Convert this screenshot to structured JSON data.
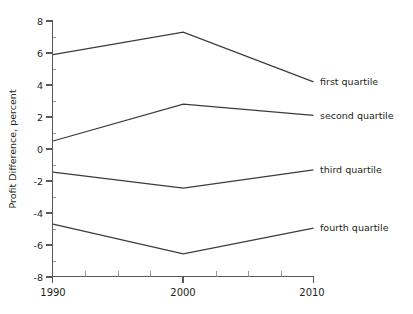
{
  "chart_data": {
    "type": "line",
    "title": "",
    "xlabel": "",
    "ylabel": "Profit Difference, percent",
    "x": [
      1990,
      2000,
      2010
    ],
    "xlim": [
      1990,
      2010
    ],
    "ylim": [
      -8,
      8
    ],
    "ytick_labels": [
      "8",
      "6",
      "4",
      "2",
      "0",
      "-2",
      "-4",
      "-6",
      "-8"
    ],
    "ytick_values": [
      8,
      6,
      4,
      2,
      0,
      -2,
      -4,
      -6,
      -8
    ],
    "xtick_labels": [
      "1990",
      "2000",
      "2010"
    ],
    "xtick_values": [
      1990,
      2000,
      2010
    ],
    "grid": false,
    "legend_position": "right-inline",
    "series": [
      {
        "name": "first quartile",
        "values": [
          5.9,
          7.3,
          4.2
        ]
      },
      {
        "name": "second quartile",
        "values": [
          0.5,
          2.8,
          2.1
        ]
      },
      {
        "name": "third quartile",
        "values": [
          -1.45,
          -2.45,
          -1.3
        ]
      },
      {
        "name": "fourth quartile",
        "values": [
          -4.7,
          -6.55,
          -4.95
        ]
      }
    ]
  },
  "labels": {
    "y_axis_title": "Profit Difference, percent",
    "series_1": "first quartile",
    "series_2": "second quartile",
    "series_3": "third quartile",
    "series_4": "fourth quartile",
    "y_8": "8",
    "y_6": "6",
    "y_4": "4",
    "y_2": "2",
    "y_0": "0",
    "y_neg2": "-2",
    "y_neg4": "-4",
    "y_neg6": "-6",
    "y_neg8": "-8",
    "x_1990": "1990",
    "x_2000": "2000",
    "x_2010": "2010"
  },
  "colors": {
    "line": "#3b3b3d",
    "axis": "#58595b",
    "text": "#231f20",
    "background": "#ffffff"
  }
}
